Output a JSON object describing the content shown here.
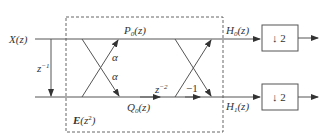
{
  "diagram": {
    "input_label": "X(z)",
    "delay_label": "z",
    "delay_exp": "−1",
    "top_node_label_main": "P",
    "top_node_label_sub": "0",
    "top_node_label_arg": "(z)",
    "bottom_node_label_main": "Q",
    "bottom_node_label_sub": "0",
    "bottom_node_label_arg": "(z)",
    "alpha_top": "α",
    "alpha_bottom": "α",
    "z2_label": "z",
    "z2_exp": "−2",
    "minus_one_label": "−1",
    "block_label_main": "E",
    "block_label_arg_open": "(z",
    "block_label_exp": "2",
    "block_label_arg_close": ")",
    "output_top_main": "H",
    "output_top_sub": "0",
    "output_top_arg": "(z)",
    "output_bottom_main": "H",
    "output_bottom_sub": "1",
    "output_bottom_arg": "(z)",
    "downsampler_top": "↓ 2",
    "downsampler_bottom": "↓ 2"
  }
}
